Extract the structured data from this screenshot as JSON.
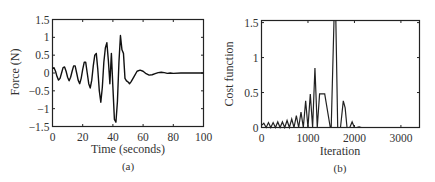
{
  "chart_data": [
    {
      "type": "line",
      "panel_label": "(a)",
      "title": "",
      "xlabel": "Time (seconds)",
      "ylabel": "Force (N)",
      "xlim": [
        0,
        100
      ],
      "ylim": [
        -1.5,
        1.5
      ],
      "xticks": [
        0,
        20,
        40,
        60,
        80,
        100
      ],
      "xtick_labels": [
        "0",
        "20",
        "40",
        "60",
        "80",
        "100"
      ],
      "yticks": [
        -1.5,
        -1,
        -0.5,
        0,
        0.5,
        1,
        1.5
      ],
      "ytick_labels": [
        "−1.5",
        "−1",
        "−0.5",
        "0",
        "0.5",
        "1",
        "1.5"
      ],
      "grid": false,
      "legend": null,
      "series": [
        {
          "name": "Force",
          "color": "#111111",
          "x": [
            0,
            1,
            2,
            3,
            4,
            5,
            6,
            7,
            8,
            9,
            10,
            11,
            12,
            13,
            14,
            15,
            16,
            17,
            18,
            19,
            20,
            21,
            22,
            23,
            24,
            25,
            26,
            27,
            28,
            29,
            30,
            31,
            32,
            33,
            34,
            35,
            36,
            37,
            38,
            39,
            40,
            41,
            42,
            43,
            44,
            45,
            46,
            47,
            48,
            49,
            50,
            51,
            52,
            54,
            56,
            58,
            60,
            62,
            64,
            66,
            68,
            70,
            72,
            74,
            76,
            78,
            80,
            85,
            90,
            95,
            100
          ],
          "y": [
            0.12,
            0.15,
            0.05,
            -0.1,
            -0.2,
            -0.15,
            0.0,
            0.15,
            0.17,
            0.05,
            -0.12,
            -0.22,
            -0.12,
            0.05,
            0.2,
            0.2,
            0.0,
            -0.2,
            -0.3,
            -0.15,
            0.1,
            0.3,
            0.3,
            0.0,
            -0.3,
            -0.42,
            -0.2,
            0.2,
            0.5,
            0.55,
            0.1,
            -0.5,
            -0.82,
            -0.4,
            0.3,
            0.7,
            0.85,
            0.35,
            -0.3,
            0.55,
            -0.4,
            -1.3,
            -1.38,
            -0.8,
            0.3,
            1.05,
            0.65,
            0.55,
            -0.15,
            -0.22,
            -0.25,
            -0.3,
            -0.25,
            -0.1,
            0.05,
            0.08,
            0.05,
            -0.02,
            -0.06,
            -0.05,
            -0.02,
            0.01,
            0.02,
            0.01,
            -0.01,
            0.0,
            -0.01,
            0.0,
            0.0,
            0.0,
            0.0
          ]
        }
      ]
    },
    {
      "type": "line",
      "panel_label": "(b)",
      "title": "",
      "xlabel": "Iteration",
      "ylabel": "Cost function",
      "xlim": [
        0,
        3400
      ],
      "ylim": [
        0,
        1.53
      ],
      "xticks": [
        0,
        1000,
        2000,
        3000
      ],
      "xtick_labels": [
        "0",
        "1000",
        "2000",
        "3000"
      ],
      "yticks": [
        0,
        0.5,
        1,
        1.5
      ],
      "ytick_labels": [
        "0",
        "0.5",
        "1",
        "1.5"
      ],
      "grid": false,
      "legend": null,
      "series": [
        {
          "name": "Cost function",
          "color": "#222222",
          "x": [
            0,
            50,
            100,
            150,
            200,
            250,
            300,
            350,
            400,
            450,
            500,
            550,
            600,
            650,
            700,
            750,
            800,
            850,
            900,
            950,
            1000,
            1050,
            1100,
            1150,
            1200,
            1250,
            1300,
            1320,
            1340,
            1360,
            1480,
            1500,
            1560,
            1600,
            1640,
            1700,
            1760,
            1800,
            1840,
            1900,
            1950,
            2000,
            2050,
            2100,
            2150,
            2300,
            2400,
            3400
          ],
          "y": [
            0.03,
            0.06,
            0.0,
            0.07,
            0.0,
            0.07,
            0.0,
            0.08,
            0.0,
            0.08,
            0.0,
            0.1,
            0.0,
            0.12,
            0.0,
            0.17,
            0.0,
            0.22,
            0.0,
            0.38,
            0.0,
            0.48,
            0.0,
            0.85,
            0.0,
            0.48,
            0.48,
            0.48,
            0.48,
            0.48,
            0.0,
            0.0,
            1.53,
            1.53,
            0.0,
            0.0,
            0.38,
            0.28,
            0.0,
            0.0,
            0.08,
            0.0,
            0.0,
            0.01,
            0.0,
            0.0,
            0.0,
            0.0
          ]
        }
      ]
    }
  ],
  "panels": {
    "a": {
      "caption": "(a)"
    },
    "b": {
      "caption": "(b)"
    }
  }
}
